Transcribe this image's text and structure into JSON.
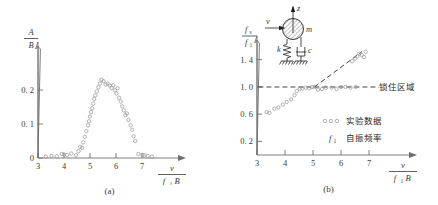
{
  "figure": {
    "background": "#ffffff",
    "marker_color": "#8d8d8d",
    "line_color": "#2b2b2b",
    "axis_color": "#6f6f6f"
  },
  "panel_a": {
    "caption": "(a)",
    "y_axis_label_num": "A",
    "y_axis_label_den": "B",
    "x_axis_label_num": "v",
    "x_axis_label_den_f": "f",
    "x_axis_label_den_sub": "1",
    "x_axis_label_den_B": "B",
    "x_ticks": [
      "3",
      "4",
      "5",
      "6",
      "7"
    ],
    "y_ticks": [
      "0",
      "0. 1",
      "0. 2"
    ]
  },
  "panel_b": {
    "caption": "(b)",
    "y_axis_label_num_f": "f",
    "y_axis_label_num_sub": "s",
    "y_axis_label_den_f": "f",
    "y_axis_label_den_sub": "1",
    "x_axis_label_num": "v",
    "x_axis_label_den_f": "f",
    "x_axis_label_den_sub": "1",
    "x_axis_label_den_B": "B",
    "x_ticks": [
      "3",
      "4",
      "5",
      "6",
      "7"
    ],
    "y_ticks": [
      "0. 2",
      "0. 6",
      "1. 0",
      "1. 4"
    ],
    "lockin_label": "锁住区域",
    "legend": [
      {
        "symbol": "circles",
        "label": "实验数据"
      },
      {
        "symbol": "f1",
        "symbol_f": "f",
        "symbol_sub": "1",
        "label": "自振频率"
      }
    ],
    "inset": {
      "mass_label": "m",
      "vertical_axis_label": "z",
      "flow_label": "v",
      "spring_label": "k",
      "damper_label": "c"
    }
  },
  "chart_data": [
    {
      "type": "scatter",
      "title": "(a)",
      "xlabel": "v / (f1 B)",
      "ylabel": "A / B",
      "xlim": [
        3,
        7.6
      ],
      "ylim": [
        0,
        0.27
      ],
      "xticks": [
        3,
        4,
        5,
        6,
        7
      ],
      "yticks": [
        0,
        0.1,
        0.2
      ],
      "grid": false,
      "legend": "none",
      "points": [
        [
          3.3,
          0.004
        ],
        [
          3.52,
          0.006
        ],
        [
          3.72,
          0.005
        ],
        [
          3.92,
          0.012
        ],
        [
          4.0,
          0.01
        ],
        [
          4.12,
          0.009
        ],
        [
          4.28,
          0.013
        ],
        [
          4.46,
          0.008
        ],
        [
          4.56,
          0.02
        ],
        [
          4.62,
          0.033
        ],
        [
          4.7,
          0.03
        ],
        [
          4.74,
          0.046
        ],
        [
          4.8,
          0.062
        ],
        [
          4.86,
          0.079
        ],
        [
          4.92,
          0.096
        ],
        [
          4.96,
          0.108
        ],
        [
          5.0,
          0.122
        ],
        [
          5.04,
          0.135
        ],
        [
          5.08,
          0.146
        ],
        [
          5.12,
          0.16
        ],
        [
          5.16,
          0.174
        ],
        [
          5.2,
          0.184
        ],
        [
          5.26,
          0.196
        ],
        [
          5.32,
          0.208
        ],
        [
          5.38,
          0.219
        ],
        [
          5.44,
          0.23
        ],
        [
          5.52,
          0.226
        ],
        [
          5.6,
          0.216
        ],
        [
          5.68,
          0.219
        ],
        [
          5.76,
          0.213
        ],
        [
          5.84,
          0.206
        ],
        [
          5.9,
          0.214
        ],
        [
          5.96,
          0.199
        ],
        [
          6.02,
          0.19
        ],
        [
          6.06,
          0.205
        ],
        [
          6.12,
          0.177
        ],
        [
          6.18,
          0.166
        ],
        [
          6.24,
          0.152
        ],
        [
          6.3,
          0.14
        ],
        [
          6.36,
          0.126
        ],
        [
          6.42,
          0.131
        ],
        [
          6.48,
          0.112
        ],
        [
          6.56,
          0.096
        ],
        [
          6.62,
          0.083
        ],
        [
          6.68,
          0.064
        ],
        [
          6.74,
          0.05
        ],
        [
          6.86,
          0.012
        ],
        [
          7.02,
          0.009
        ],
        [
          7.1,
          0.008
        ],
        [
          7.22,
          0.006
        ],
        [
          7.38,
          0.004
        ]
      ]
    },
    {
      "type": "scatter",
      "title": "(b)",
      "xlabel": "v / (f1 B)",
      "ylabel": "fs / f1",
      "xlim": [
        3,
        7.5
      ],
      "ylim": [
        0,
        1.62
      ],
      "xticks": [
        3,
        4,
        5,
        6,
        7
      ],
      "yticks": [
        0.2,
        0.6,
        1.0,
        1.4
      ],
      "grid": false,
      "legend_position": "lower-right-inside",
      "points": [
        [
          3.34,
          0.63
        ],
        [
          3.44,
          0.62
        ],
        [
          3.62,
          0.68
        ],
        [
          3.76,
          0.7
        ],
        [
          3.92,
          0.74
        ],
        [
          4.06,
          0.78
        ],
        [
          4.22,
          0.82
        ],
        [
          4.34,
          0.88
        ],
        [
          4.42,
          0.94
        ],
        [
          4.52,
          0.97
        ],
        [
          4.62,
          0.98
        ],
        [
          4.74,
          0.99
        ],
        [
          4.86,
          0.98
        ],
        [
          4.96,
          1.0
        ],
        [
          5.06,
          1.0
        ],
        [
          5.18,
          0.96
        ],
        [
          5.32,
          0.97
        ],
        [
          5.46,
          0.99
        ],
        [
          5.66,
          0.99
        ],
        [
          5.84,
          0.97
        ],
        [
          6.0,
          1.0
        ],
        [
          6.16,
          1.0
        ],
        [
          6.34,
          0.99
        ],
        [
          6.52,
          1.0
        ],
        [
          6.4,
          1.38
        ],
        [
          6.5,
          1.42
        ],
        [
          6.58,
          1.45
        ],
        [
          6.66,
          1.49
        ],
        [
          6.74,
          1.47
        ],
        [
          6.82,
          1.44
        ],
        [
          6.88,
          1.52
        ]
      ],
      "lines": [
        {
          "name": "lock-in-horizontal",
          "style": "dashed",
          "x": [
            3.05,
            7.35
          ],
          "y": [
            1.0,
            1.0
          ]
        },
        {
          "name": "strouhal-trend",
          "style": "dashed",
          "x": [
            5.05,
            6.75
          ],
          "y": [
            1.0,
            1.52
          ]
        }
      ],
      "annotations": [
        {
          "text": "锁住区域",
          "x": 7.0,
          "y": 1.0
        }
      ]
    }
  ]
}
